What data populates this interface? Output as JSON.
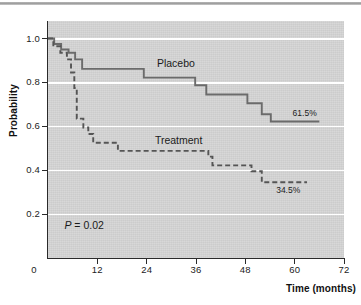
{
  "figure": {
    "top_rule": "horizontal-divider"
  },
  "chart_data": {
    "type": "line",
    "subtype": "kaplan-meier-step",
    "title": "",
    "xlabel": "Time (months)",
    "ylabel": "Probability",
    "xlim": [
      0,
      72
    ],
    "ylim": [
      0,
      1.08
    ],
    "xticks": [
      "0",
      "12",
      "24",
      "36",
      "48",
      "60",
      "72"
    ],
    "xtick_values": [
      0,
      12,
      24,
      36,
      48,
      60,
      72
    ],
    "yticks": [
      "0.2",
      "0.4",
      "0.6",
      "0.8",
      "1.0"
    ],
    "ytick_values": [
      0.2,
      0.4,
      0.6,
      0.8,
      1.0
    ],
    "grid": "horizontal-white-gridlines",
    "grid_color": "#ffffff",
    "plot_background": "#d6d6d6",
    "legend": "inline-labels",
    "series": [
      {
        "name": "Placebo",
        "style": "solid",
        "color": "#6b6b6b",
        "label": "Placebo",
        "label_x": 26.5,
        "label_y": 0.885,
        "end_label": "61.5%",
        "end_label_x": 59.5,
        "end_label_y": 0.655,
        "points": [
          [
            0,
            1.0
          ],
          [
            1.5,
            1.0
          ],
          [
            1.5,
            0.975
          ],
          [
            3.2,
            0.975
          ],
          [
            3.2,
            0.95
          ],
          [
            5.0,
            0.95
          ],
          [
            5.0,
            0.935
          ],
          [
            6.6,
            0.935
          ],
          [
            6.6,
            0.905
          ],
          [
            8.3,
            0.905
          ],
          [
            8.3,
            0.862
          ],
          [
            23.3,
            0.862
          ],
          [
            23.3,
            0.822
          ],
          [
            35.8,
            0.822
          ],
          [
            35.8,
            0.787
          ],
          [
            38.5,
            0.787
          ],
          [
            38.5,
            0.745
          ],
          [
            48.5,
            0.745
          ],
          [
            48.5,
            0.705
          ],
          [
            52.0,
            0.705
          ],
          [
            52.0,
            0.655
          ],
          [
            54.2,
            0.655
          ],
          [
            54.2,
            0.622
          ],
          [
            66.0,
            0.622
          ]
        ]
      },
      {
        "name": "Treatment",
        "style": "dashed",
        "color": "#555555",
        "label": "Treatment",
        "label_x": 26.0,
        "label_y": 0.535,
        "end_label": "34.5%",
        "end_label_x": 55.5,
        "end_label_y": 0.305,
        "points": [
          [
            0,
            1.0
          ],
          [
            1.3,
            1.0
          ],
          [
            1.3,
            0.965
          ],
          [
            3.0,
            0.965
          ],
          [
            3.0,
            0.935
          ],
          [
            4.6,
            0.935
          ],
          [
            4.6,
            0.905
          ],
          [
            5.6,
            0.905
          ],
          [
            5.6,
            0.845
          ],
          [
            6.4,
            0.845
          ],
          [
            6.4,
            0.775
          ],
          [
            7.0,
            0.775
          ],
          [
            7.0,
            0.635
          ],
          [
            8.6,
            0.635
          ],
          [
            8.6,
            0.595
          ],
          [
            9.8,
            0.595
          ],
          [
            9.8,
            0.565
          ],
          [
            11.0,
            0.565
          ],
          [
            11.0,
            0.525
          ],
          [
            17.0,
            0.525
          ],
          [
            17.0,
            0.488
          ],
          [
            39.0,
            0.488
          ],
          [
            39.0,
            0.462
          ],
          [
            40.0,
            0.462
          ],
          [
            40.0,
            0.422
          ],
          [
            49.5,
            0.422
          ],
          [
            49.5,
            0.395
          ],
          [
            52.0,
            0.395
          ],
          [
            52.0,
            0.345
          ],
          [
            63.0,
            0.345
          ]
        ]
      }
    ],
    "annotations": [
      {
        "id": "p-value",
        "text_prefix": "P",
        "text_rest": " = 0.02",
        "x": 4.0,
        "y": 0.145
      }
    ]
  }
}
